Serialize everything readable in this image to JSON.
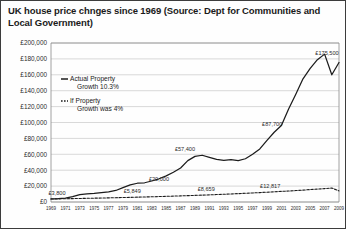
{
  "chart_data": {
    "type": "line",
    "title": "UK house price chnges since 1969 (Source: Dept for Communities and Local Government)",
    "xlabel": "",
    "ylabel": "",
    "ylim": [
      0,
      200000
    ],
    "ytick_values": [
      0,
      20000,
      40000,
      60000,
      80000,
      100000,
      120000,
      140000,
      160000,
      180000,
      200000
    ],
    "ytick_labels": [
      "£0",
      "£20,000",
      "£40,000",
      "£60,000",
      "£80,000",
      "£100,000",
      "£120,000",
      "£140,000",
      "£160,000",
      "£180,000",
      "£200,000"
    ],
    "grid": true,
    "legend_position": "upper-left-inside",
    "categories": [
      1969,
      1970,
      1971,
      1972,
      1973,
      1974,
      1975,
      1976,
      1977,
      1978,
      1979,
      1980,
      1981,
      1982,
      1983,
      1984,
      1985,
      1986,
      1987,
      1988,
      1989,
      1990,
      1991,
      1992,
      1993,
      1994,
      1995,
      1996,
      1997,
      1998,
      1999,
      2000,
      2001,
      2002,
      2003,
      2004,
      2005,
      2006,
      2007,
      2008,
      2009
    ],
    "xtick_labels": [
      "1969",
      "1971",
      "1973",
      "1975",
      "1977",
      "1979",
      "1981",
      "1983",
      "1985",
      "1987",
      "1989",
      "1991",
      "1993",
      "1995",
      "1997",
      "1999",
      "2001",
      "2003",
      "2005",
      "2007",
      "2009"
    ],
    "series": [
      {
        "name": "Actual Property Growth 10.3%",
        "style": "solid",
        "values": [
          3800,
          4100,
          4900,
          6800,
          9200,
          10100,
          10800,
          11800,
          12800,
          14500,
          18000,
          21500,
          23600,
          24200,
          26400,
          29200,
          32800,
          37400,
          42800,
          52000,
          57400,
          58800,
          56200,
          53500,
          52500,
          53300,
          52000,
          54400,
          60000,
          66800,
          77500,
          87700,
          96200,
          117000,
          135500,
          155000,
          168000,
          179000,
          186000,
          160000,
          175500
        ]
      },
      {
        "name": "If Property Growth was 4%",
        "style": "dotted",
        "values": [
          3800,
          3952,
          4110,
          4274,
          4445,
          4623,
          4808,
          5000,
          5200,
          5408,
          5625,
          5849,
          6083,
          6327,
          6580,
          6843,
          7117,
          7401,
          7697,
          8005,
          8326,
          8659,
          9005,
          9365,
          9740,
          10129,
          10535,
          10956,
          11394,
          11850,
          12324,
          12817,
          13330,
          13863,
          14417,
          14994,
          15594,
          16218,
          16866,
          17541,
          13973
        ]
      }
    ],
    "data_labels": [
      {
        "text": "£3,800",
        "x": 1969,
        "y": 3800
      },
      {
        "text": "£5,849",
        "x": 1980,
        "y": 5849
      },
      {
        "text": "£8,659",
        "x": 1990,
        "y": 8659
      },
      {
        "text": "£20,000",
        "x": 1984,
        "y": 20000
      },
      {
        "text": "£57,400",
        "x": 1989,
        "y": 57400
      },
      {
        "text": "£12,817",
        "x": 2000,
        "y": 12817
      },
      {
        "text": "£87,700",
        "x": 2000,
        "y": 87700
      },
      {
        "text": "£175,500",
        "x": 2009,
        "y": 175500
      }
    ],
    "legend": [
      {
        "label_line1": "Actual Property",
        "label_line2": "Growth 10.3%",
        "style": "solid"
      },
      {
        "label_line1": "If Property",
        "label_line2": "Growth was 4%",
        "style": "dotted"
      }
    ]
  }
}
